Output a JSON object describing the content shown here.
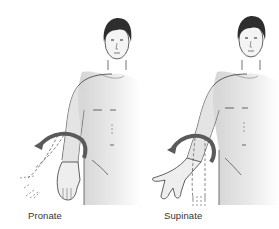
{
  "diagram": {
    "panels": [
      {
        "id": "pronate",
        "label": "Pronate",
        "arrow_direction": "counter-clockwise",
        "moved_hand": "palm facing body / back"
      },
      {
        "id": "supinate",
        "label": "Supinate",
        "arrow_direction": "clockwise",
        "moved_hand": "palm facing forward / up"
      }
    ],
    "colors": {
      "line": "#3a3a3a",
      "arrow": "#5a5a5a",
      "skin_shade": "#d9d9d9",
      "hair": "#2e2e2e",
      "background": "#ffffff"
    }
  }
}
